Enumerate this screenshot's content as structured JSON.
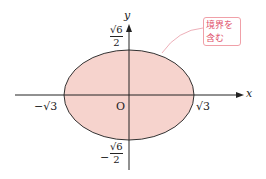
{
  "diagram": {
    "type": "ellipse-region",
    "axis_x_label": "x",
    "axis_y_label": "y",
    "origin_label": "O",
    "x_neg_label": "−√3",
    "x_pos_label": "√3",
    "y_pos_label": {
      "num": "√6",
      "den": "2"
    },
    "y_neg_label": {
      "sign": "−",
      "num": "√6",
      "den": "2"
    },
    "callout": {
      "line1": "境界を",
      "line2": "含む"
    },
    "colors": {
      "fill": "#f6d3cd",
      "stroke": "#333333",
      "callout": "#e0506a",
      "callout_border": "#f0a0a8"
    }
  }
}
